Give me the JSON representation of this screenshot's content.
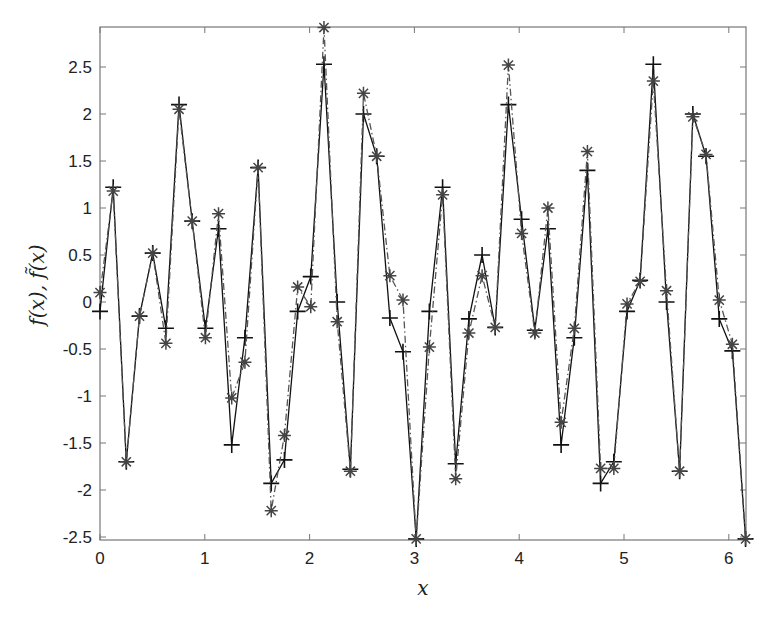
{
  "chart_data": {
    "type": "line",
    "title": "",
    "xlabel": "x",
    "ylabel": "f(x),  f̃(x)",
    "xlim": [
      0,
      6.16
    ],
    "ylim": [
      -2.55,
      2.93
    ],
    "xticks": [
      0,
      1,
      2,
      3,
      4,
      5,
      6
    ],
    "xtick_labels": [
      "0",
      "1",
      "2",
      "3",
      "4",
      "5",
      "6"
    ],
    "yticks": [
      -2.5,
      -2,
      -1.5,
      -1,
      -0.5,
      0,
      0.5,
      1,
      1.5,
      2,
      2.5
    ],
    "ytick_labels": [
      "-2.5",
      "-2",
      "-1.5",
      "-1",
      "-0.5",
      "0",
      "0.5",
      "1",
      "1.5",
      "2",
      "2.5"
    ],
    "grid": false,
    "legend": null,
    "x": [
      0.0,
      0.126,
      0.251,
      0.377,
      0.503,
      0.629,
      0.754,
      0.88,
      1.006,
      1.131,
      1.257,
      1.383,
      1.509,
      1.634,
      1.76,
      1.886,
      2.011,
      2.137,
      2.263,
      2.389,
      2.514,
      2.64,
      2.766,
      2.891,
      3.017,
      3.143,
      3.269,
      3.394,
      3.52,
      3.646,
      3.771,
      3.897,
      4.023,
      4.149,
      4.274,
      4.4,
      4.526,
      4.651,
      4.777,
      4.903,
      5.029,
      5.154,
      5.28,
      5.406,
      5.531,
      5.657,
      5.783,
      5.909,
      6.034,
      6.16
    ],
    "series": [
      {
        "name": "f(x)",
        "marker": "+",
        "line_style": "solid",
        "color": "#111111",
        "values": [
          -0.1,
          1.22,
          -1.7,
          -0.15,
          0.52,
          -0.28,
          2.1,
          0.86,
          -0.28,
          0.78,
          -1.52,
          -0.38,
          1.43,
          -1.93,
          -1.68,
          -0.1,
          0.27,
          2.53,
          0.0,
          -1.78,
          2.0,
          1.55,
          -0.17,
          -0.53,
          -2.52,
          -0.1,
          1.22,
          -1.72,
          -0.18,
          0.5,
          -0.27,
          2.1,
          0.88,
          -0.3,
          0.78,
          -1.52,
          -0.38,
          1.4,
          -1.93,
          -1.7,
          -0.1,
          0.23,
          2.53,
          0.0,
          -1.8,
          2.0,
          1.55,
          -0.18,
          -0.52,
          -2.52
        ]
      },
      {
        "name": "f̃(x)",
        "marker": "*",
        "line_style": "dashdot",
        "color": "#555555",
        "values": [
          0.1,
          1.18,
          -1.7,
          -0.15,
          0.52,
          -0.44,
          2.05,
          0.86,
          -0.38,
          0.94,
          -1.02,
          -0.64,
          1.43,
          -2.22,
          -1.42,
          0.16,
          -0.05,
          2.92,
          -0.21,
          -1.8,
          2.22,
          1.55,
          0.28,
          0.02,
          -2.52,
          -0.48,
          1.14,
          -1.88,
          -0.33,
          0.28,
          -0.27,
          2.52,
          0.73,
          -0.33,
          1.0,
          -1.28,
          -0.28,
          1.6,
          -1.77,
          -1.77,
          -0.02,
          0.22,
          2.35,
          0.12,
          -1.8,
          1.97,
          1.57,
          0.02,
          -0.45,
          -2.52
        ]
      }
    ]
  },
  "layout": {
    "plot_left": 100,
    "plot_right": 746,
    "plot_top": 27,
    "plot_bottom": 540,
    "x_px_per_unit": 104.8,
    "y_zero_px": 302,
    "y_px_per_unit": 94
  }
}
